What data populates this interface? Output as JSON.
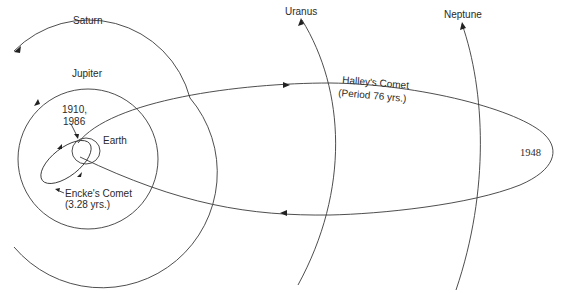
{
  "diagram": {
    "colors": {
      "line": "#3a3a3a",
      "text": "#2a2a2a",
      "background": "#ffffff"
    },
    "labels": {
      "saturn": "Saturn",
      "jupiter": "Jupiter",
      "uranus": "Uranus",
      "neptune": "Neptune",
      "earth": "Earth",
      "halley_line1": "Halley's Comet",
      "halley_line2": "(Period 76 yrs.)",
      "encke_line1": "Encke's Comet",
      "encke_line2": "(3.28 yrs.)",
      "perihelion_line1": "1910,",
      "perihelion_line2": "1986",
      "aphelion": "1948"
    },
    "bodies": [
      {
        "name": "Earth",
        "type": "planet-orbit"
      },
      {
        "name": "Jupiter",
        "type": "planet-orbit"
      },
      {
        "name": "Saturn",
        "type": "planet-orbit"
      },
      {
        "name": "Uranus",
        "type": "planet-orbit"
      },
      {
        "name": "Neptune",
        "type": "planet-orbit"
      },
      {
        "name": "Halley's Comet",
        "type": "comet-orbit",
        "period": "76 yrs."
      },
      {
        "name": "Encke's Comet",
        "type": "comet-orbit",
        "period": "3.28 yrs."
      }
    ]
  }
}
